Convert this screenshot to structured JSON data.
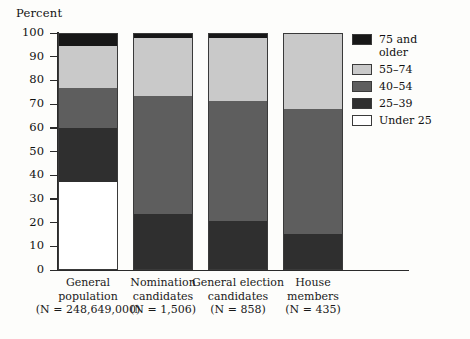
{
  "chart_data": {
    "type": "bar",
    "subtype": "stacked-100-percent",
    "title": "",
    "ylabel": "Percent",
    "xlabel": "",
    "ylim": [
      0,
      100
    ],
    "yticks": [
      0,
      10,
      20,
      30,
      40,
      50,
      60,
      70,
      80,
      90,
      100
    ],
    "grid": false,
    "legend_position": "right",
    "categories": [
      "General population",
      "Nomination candidates",
      "General election candidates",
      "House members"
    ],
    "category_notes": [
      "(N = 248,649,000)",
      "(N = 1,506)",
      "(N = 858)",
      "(N = 435)"
    ],
    "series": [
      {
        "name": "75 and older",
        "color": "#171717",
        "values": [
          5,
          1.5,
          1.5,
          0
        ]
      },
      {
        "name": "55–74",
        "color": "#c9c9c9",
        "values": [
          18,
          25,
          27,
          32
        ]
      },
      {
        "name": "40–54",
        "color": "#5e5e5e",
        "values": [
          17,
          50,
          51,
          53
        ]
      },
      {
        "name": "25–39",
        "color": "#2f2f2f",
        "values": [
          23,
          23.5,
          20.5,
          15
        ]
      },
      {
        "name": "Under 25",
        "color": "#ffffff",
        "values": [
          37,
          0,
          0,
          0
        ]
      }
    ]
  },
  "axis": {
    "y_title": "Percent",
    "ticks": [
      "100",
      "90",
      "80",
      "70",
      "60",
      "50",
      "40",
      "30",
      "20",
      "10",
      "0"
    ]
  },
  "categories": [
    {
      "line1": "General",
      "line2": "population",
      "note": "(N = 248,649,000)"
    },
    {
      "line1": "Nomination",
      "line2": "candidates",
      "note": "(N = 1,506)"
    },
    {
      "line1": "General election",
      "line2": "candidates",
      "note": "(N = 858)"
    },
    {
      "line1": "House",
      "line2": "members",
      "note": "(N = 435)"
    }
  ],
  "legend": {
    "items": [
      {
        "label": "75 and",
        "label2": "older",
        "swatch": "sw-75"
      },
      {
        "label": "55–74",
        "label2": "",
        "swatch": "sw-55"
      },
      {
        "label": "40–54",
        "label2": "",
        "swatch": "sw-40"
      },
      {
        "label": "25–39",
        "label2": "",
        "swatch": "sw-25"
      },
      {
        "label": "Under 25",
        "label2": "",
        "swatch": "sw-un"
      }
    ]
  }
}
